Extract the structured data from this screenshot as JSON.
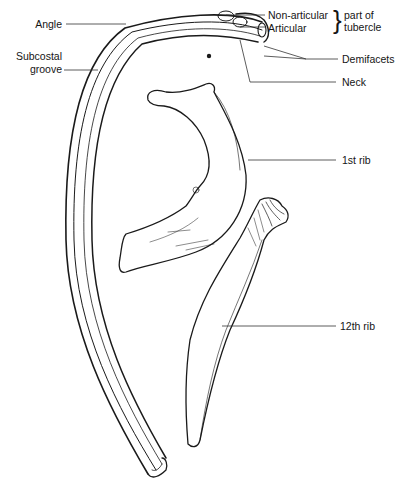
{
  "figure": {
    "labels": {
      "angle": "Angle",
      "subcostal_groove_line1": "Subcostal",
      "subcostal_groove_line2": "groove",
      "non_articular": "Non-articular",
      "articular": "Articular",
      "tubercle_line1": "part of",
      "tubercle_line2": "tubercle",
      "demifacets": "Demifacets",
      "neck": "Neck",
      "first_rib": "1st rib",
      "twelfth_rib": "12th rib"
    },
    "colors": {
      "ink": "#1a1a1a",
      "background": "#ffffff",
      "leader_line": "#333333"
    }
  }
}
